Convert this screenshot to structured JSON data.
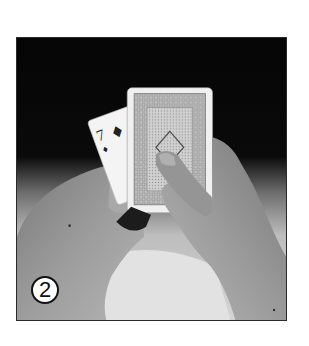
{
  "figure": {
    "type": "instructional-photo",
    "step_number": "2",
    "visible_card": {
      "rank": "7",
      "suit": "diamond",
      "suit_glyph": "♦"
    },
    "deck_back_pattern": "ornate lattice border with central diamond",
    "colors": {
      "background_top": "#050505",
      "skin": "#8c8c8c",
      "table": "#d8d8d8",
      "card_face": "#f5f5f5",
      "card_back_pattern": "#9a9a9a",
      "frame_border": "#2a2a2a"
    }
  }
}
